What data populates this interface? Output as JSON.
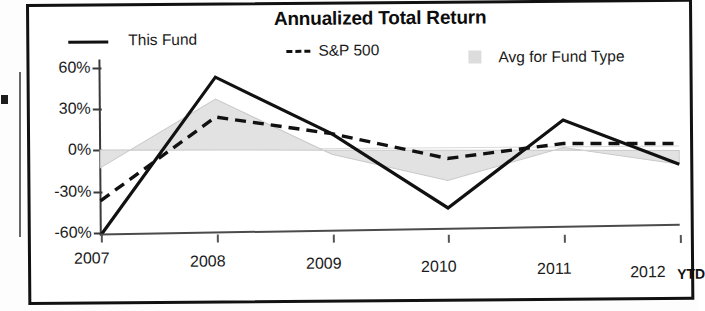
{
  "chart_data": {
    "type": "line",
    "title": "Annualized Total Return",
    "xlabel": "",
    "ylabel": "",
    "x": [
      "2007",
      "2008",
      "2009",
      "2010",
      "2011",
      "2012"
    ],
    "categories": [
      "2007",
      "2008",
      "2009",
      "2010",
      "2011",
      "2012"
    ],
    "xtick_labels": [
      "2007",
      "2008",
      "2009",
      "2010",
      "2011",
      "2012"
    ],
    "x_axis_note": "YTD",
    "ytick_labels": [
      "60%",
      "30%",
      "0%",
      "-30%",
      "-60%"
    ],
    "ytick_values": [
      60,
      30,
      0,
      -30,
      -60
    ],
    "ylim": [
      -70,
      62
    ],
    "grid": false,
    "legend_position": "top",
    "series": [
      {
        "name": "This Fund",
        "style": "solid",
        "color": "#111111",
        "values": [
          -62,
          53,
          12,
          -42,
          22,
          -10
        ]
      },
      {
        "name": "S&P 500",
        "style": "dashed",
        "color": "#111111",
        "values": [
          -37,
          24,
          12,
          -6,
          5,
          5
        ]
      },
      {
        "name": "Avg for Fund Type",
        "style": "filled-area",
        "color": "#dcdcdc",
        "values": [
          -13,
          37,
          -3,
          -22,
          2,
          -10
        ]
      }
    ]
  },
  "chart": {
    "title": "Annualized Total Return",
    "legend": [
      {
        "label": "This Fund",
        "marker": "solid-line-swatch"
      },
      {
        "label": "S&P 500",
        "marker": "dashed-line-swatch"
      },
      {
        "label": "Avg for Fund Type",
        "marker": "filled-square-swatch"
      }
    ],
    "y_axis": {
      "labels": [
        "60%",
        "30%",
        "0%",
        "-30%",
        "-60%"
      ]
    },
    "x_axis": {
      "labels": [
        "2007",
        "2008",
        "2009",
        "2010",
        "2011",
        "2012"
      ],
      "suffix": "YTD"
    }
  },
  "colors": {
    "fund_line": "#111111",
    "sp500_line": "#111111",
    "avg_fill": "#dcdcdc",
    "axis": "#3a3a3a",
    "frame": "#111111"
  }
}
